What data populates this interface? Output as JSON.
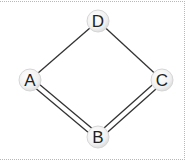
{
  "diagram": {
    "type": "graph",
    "nodes": [
      {
        "id": "D",
        "label": "D",
        "x": 98,
        "y": 21
      },
      {
        "id": "A",
        "label": "A",
        "x": 30,
        "y": 80
      },
      {
        "id": "C",
        "label": "C",
        "x": 162,
        "y": 80
      },
      {
        "id": "B",
        "label": "B",
        "x": 98,
        "y": 137
      }
    ],
    "edges": [
      {
        "from": "D",
        "to": "A",
        "style": "single"
      },
      {
        "from": "D",
        "to": "C",
        "style": "single"
      },
      {
        "from": "A",
        "to": "B",
        "style": "double"
      },
      {
        "from": "B",
        "to": "C",
        "style": "double"
      }
    ],
    "colors": {
      "edge": "#333333",
      "node_fill": "#f2f2f2",
      "node_stroke": "#d6d6d6",
      "label": "#222222",
      "frame": "#b8b8b8"
    }
  }
}
